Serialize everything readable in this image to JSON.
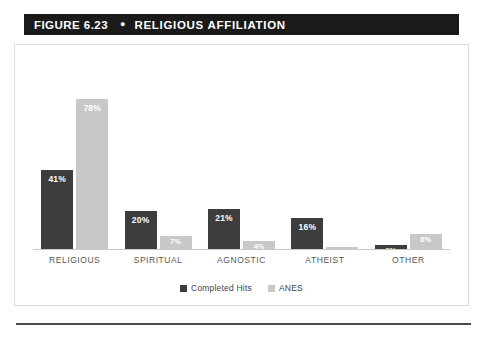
{
  "header": {
    "figure_number": "FIGURE 6.23",
    "separator_icon": "bullet-dot",
    "title": "RELIGIOUS AFFILIATION",
    "background_color": "#1a1a1a",
    "text_color": "#ffffff"
  },
  "chart_data": {
    "type": "bar",
    "title": "RELIGIOUS AFFILIATION",
    "xlabel": "",
    "ylabel": "",
    "grid": false,
    "legend_position": "bottom-center",
    "axis_visible": false,
    "ylim": [
      0,
      100
    ],
    "categories": [
      "RELIGIOUS",
      "SPIRITUAL",
      "AGNOSTIC",
      "ATHEIST",
      "OTHER"
    ],
    "series": [
      {
        "name": "Completed Hits",
        "color": "#3d3d3d",
        "values": [
          41,
          20,
          21,
          16,
          2
        ],
        "labels": [
          "41%",
          "20%",
          "21%",
          "16%",
          "2%"
        ]
      },
      {
        "name": "ANES",
        "color": "#c8c8c8",
        "values": [
          78,
          7,
          4,
          1,
          8
        ],
        "labels": [
          "78%",
          "7%",
          "4%",
          "1%",
          "8%"
        ]
      }
    ]
  },
  "legend": {
    "entries": [
      {
        "label": "Completed Hits",
        "color": "#3d3d3d"
      },
      {
        "label": "ANES",
        "color": "#c8c8c8"
      }
    ]
  }
}
